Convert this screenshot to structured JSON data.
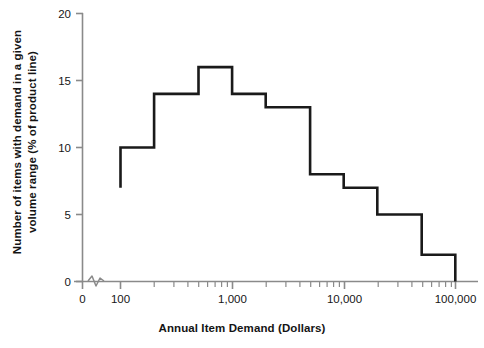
{
  "chart_data": {
    "type": "line",
    "variant": "step-histogram",
    "title": "",
    "xlabel": "Annual Item Demand (Dollars)",
    "ylabel": "Number of items with demand in a given volume range (% of product line)",
    "ylabel_line1": "Number of items with demand in a given",
    "ylabel_line2": "volume range (% of product line)",
    "xscale": "log",
    "yscale": "linear",
    "xlim": [
      100,
      100000
    ],
    "ylim": [
      0,
      20
    ],
    "xtick_labels": [
      "0",
      "100",
      "1,000",
      "10,000",
      "100,000"
    ],
    "xtick_values": [
      0,
      100,
      1000,
      10000,
      100000
    ],
    "ytick_labels": [
      "0",
      "5",
      "10",
      "15",
      "20"
    ],
    "ytick_values": [
      0,
      5,
      10,
      15,
      20
    ],
    "grid": false,
    "legend": null,
    "axis_break": true,
    "axis_break_note": "zigzag break on x-axis between 0 and 100",
    "minor_ticks": "log decade minor ticks at 2-9 within each decade",
    "line_color": "#1a1a1a",
    "axis_color": "#8a8a8a",
    "background_color": "#ffffff",
    "bin_edges": [
      100,
      200,
      500,
      1000,
      2000,
      5000,
      10000,
      20000,
      50000,
      100000
    ],
    "bin_edge_labels": [
      "100",
      "200",
      "500",
      "1,000",
      "2,000",
      "5,000",
      "10,000",
      "20,000",
      "50,000",
      "100,000"
    ],
    "values": [
      10,
      14,
      16,
      14,
      13,
      8,
      7,
      5,
      2
    ],
    "start_value": 7,
    "end_value": 0,
    "bins": [
      {
        "from": 100,
        "to": 200,
        "value": 10
      },
      {
        "from": 200,
        "to": 500,
        "value": 14
      },
      {
        "from": 500,
        "to": 1000,
        "value": 16
      },
      {
        "from": 1000,
        "to": 2000,
        "value": 14
      },
      {
        "from": 2000,
        "to": 5000,
        "value": 13
      },
      {
        "from": 5000,
        "to": 10000,
        "value": 8
      },
      {
        "from": 10000,
        "to": 20000,
        "value": 7
      },
      {
        "from": 20000,
        "to": 50000,
        "value": 5
      },
      {
        "from": 50000,
        "to": 100000,
        "value": 2
      }
    ]
  }
}
